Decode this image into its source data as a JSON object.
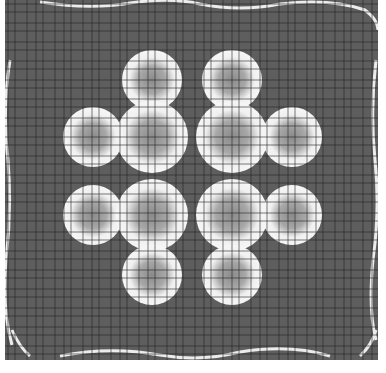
{
  "image": {
    "kind": "grayscale-pattern-field",
    "description": "Gridded gray field with four three-lobed bright blob clusters arranged symmetrically",
    "colors": {
      "background": "#ffffff",
      "field": "#5e5e5e",
      "grid": "#2a2a2a",
      "blob_rim": "#f2f2f2",
      "blob_core": "#8a8a8a",
      "edge_highlight": "#e8e8e8"
    },
    "field_bounds": {
      "x": 5,
      "y": 0,
      "width": 373,
      "height": 360
    },
    "clusters": [
      {
        "name": "top-left",
        "lobes": [
          {
            "cx": 152,
            "cy": 80,
            "r": 22
          },
          {
            "cx": 152,
            "cy": 137,
            "r": 28
          },
          {
            "cx": 93,
            "cy": 137,
            "r": 22
          }
        ]
      },
      {
        "name": "top-right",
        "lobes": [
          {
            "cx": 232,
            "cy": 80,
            "r": 22
          },
          {
            "cx": 232,
            "cy": 137,
            "r": 28
          },
          {
            "cx": 292,
            "cy": 137,
            "r": 22
          }
        ]
      },
      {
        "name": "bottom-left",
        "lobes": [
          {
            "cx": 93,
            "cy": 215,
            "r": 22
          },
          {
            "cx": 152,
            "cy": 215,
            "r": 28
          },
          {
            "cx": 152,
            "cy": 275,
            "r": 22
          }
        ]
      },
      {
        "name": "bottom-right",
        "lobes": [
          {
            "cx": 232,
            "cy": 215,
            "r": 28
          },
          {
            "cx": 292,
            "cy": 215,
            "r": 22
          },
          {
            "cx": 232,
            "cy": 275,
            "r": 22
          }
        ]
      }
    ]
  }
}
